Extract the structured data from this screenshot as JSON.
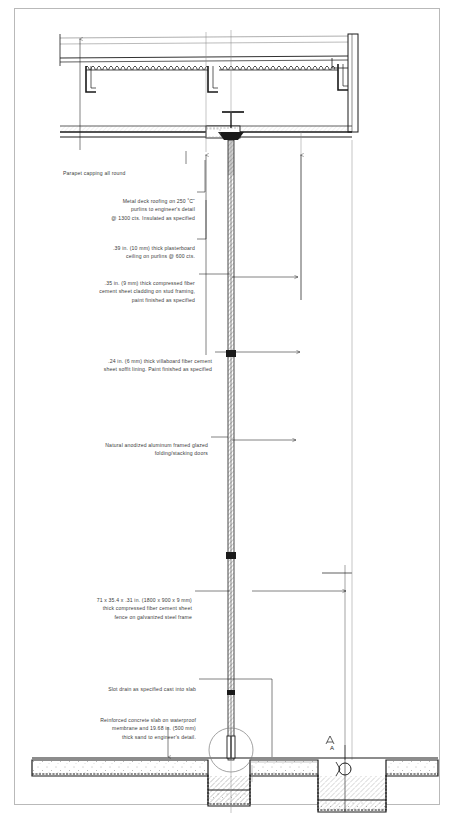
{
  "document": {
    "type": "architectural-section-drawing",
    "title": "Building section detail",
    "border_color": "#b9b9b9",
    "background_color": "#ffffff",
    "ink_color": "#1a1a1a",
    "note_color": "#3b3b3b"
  },
  "notes": [
    {
      "id": "parapet",
      "text": "Parapet capping all round",
      "align": "left",
      "x": 63,
      "y": 160,
      "width": 120,
      "leader": {
        "type": "vertical-stub",
        "x": 80,
        "y1": 150,
        "y2": 160
      }
    },
    {
      "id": "metal-deck-roofing",
      "text": "Metal deck roofing on 250 ˚C˜\npurlins to engineer's detail\n@ 1300 cts. Insulated as specified",
      "align": "right",
      "x": 60,
      "y": 189,
      "width": 135
    },
    {
      "id": "plasterboard-ceiling",
      "text": ".39 in. (10 mm) thick plasterboard\nceiling on purlins @ 600 cts.",
      "align": "right",
      "x": 60,
      "y": 236,
      "width": 135
    },
    {
      "id": "fiber-cement-cladding",
      "text": ".35 in. (9 mm)  thick compressed fiber\ncement sheet cladding on stud framing,\npaint finished as specified",
      "align": "right",
      "x": 56,
      "y": 271,
      "width": 139
    },
    {
      "id": "villaboard-soffit",
      "text": ".24 in. (6 mm) thick villaboard fiber cement\nsheet soffit lining. Paint finished as specified",
      "align": "right",
      "x": 52,
      "y": 349,
      "width": 160
    },
    {
      "id": "folding-stacking-doors",
      "text": "Natural anodized aluminum framed glazed\nfolding/stacking doors",
      "align": "right",
      "x": 56,
      "y": 433,
      "width": 152
    },
    {
      "id": "fence-panels",
      "text": "71 x 35.4 x .31 in. (1800 x 900 x 9 mm)\nthick compressed fiber cement sheet\nfence on galvanized steel frame",
      "align": "right",
      "x": 58,
      "y": 588,
      "width": 134
    },
    {
      "id": "slot-drain",
      "text": "Slot drain as specified cast into slab",
      "align": "right",
      "x": 70,
      "y": 677,
      "width": 126
    },
    {
      "id": "concrete-slab",
      "text": "Reinforced concrete slab on waterproof\nmembrane and 19.68 in. (500 mm)\nthick sand to engineer's detail.",
      "align": "right",
      "x": 54,
      "y": 708,
      "width": 142
    }
  ],
  "leaders": [
    {
      "id": "leader-metal-deck",
      "points": "196,191 204,191 204,199"
    },
    {
      "id": "leader-plasterboard",
      "points": "196,239 206,239 206,150"
    },
    {
      "id": "leader-cladding",
      "points": "196,274 228,274"
    },
    {
      "id": "leader-villaboard",
      "points": "213,352 232,352"
    },
    {
      "id": "leader-doors",
      "points": "209,436 228,436"
    },
    {
      "id": "leader-fence",
      "points": "193,591 228,591"
    },
    {
      "id": "leader-slot-drain",
      "points": "197,679 272,679 272,755"
    },
    {
      "id": "leader-slab",
      "points": "197,712 214,712 214,745 225,745"
    }
  ],
  "dimension_arrows": [
    {
      "id": "dim-arrow-roof-left",
      "x": 80,
      "y_top": 37,
      "y_bottom": 150,
      "head": "up"
    },
    {
      "id": "dim-arrow-soffit-left",
      "x": 206,
      "y_top": 155,
      "y_bottom": 355,
      "head": "up"
    },
    {
      "id": "dim-arrow-soffit-right",
      "x": 301,
      "y_top": 155,
      "y_bottom": 300,
      "head": "up"
    },
    {
      "id": "dim-arrow-cladding",
      "x": 228,
      "y_top": 274,
      "y_bottom": 352,
      "head": "none"
    },
    {
      "id": "dim-arrow-fence-right",
      "x": 345,
      "y_top": 567,
      "y_bottom": 595,
      "head": "right"
    },
    {
      "id": "dim-arrow-slab-down",
      "x": 168,
      "y_top": 728,
      "y_bottom": 758,
      "head": "down"
    }
  ],
  "components": {
    "roof_deck": {
      "label": "metal-deck-roof",
      "y": 60,
      "height": 18
    },
    "ceiling": {
      "label": "plasterboard-ceiling",
      "y": 78
    },
    "soffit": {
      "label": "soffit-beam",
      "y": 128,
      "height": 12
    },
    "column": {
      "label": "central-column",
      "x": 231,
      "y_top": 140,
      "y_bottom": 760
    },
    "fence": {
      "label": "fiber-cement-fence",
      "x": 231,
      "y_top": 352,
      "y_bottom": 690
    },
    "slab": {
      "label": "concrete-slab",
      "y": 760,
      "height": 14
    },
    "footing_left": {
      "label": "footing-left",
      "x": 208,
      "width": 42
    },
    "footing_right": {
      "label": "footing-right",
      "x": 318,
      "width": 68
    },
    "drain_circle": {
      "label": "slot-drain-detail",
      "cx": 231,
      "cy": 750,
      "r": 22
    },
    "pipe_circle": {
      "label": "pipe-section",
      "cx": 345,
      "cy": 769,
      "r": 6
    }
  },
  "annotation_marks": [
    {
      "id": "section-mark-a",
      "text": "A",
      "x": 330,
      "y": 748
    }
  ]
}
